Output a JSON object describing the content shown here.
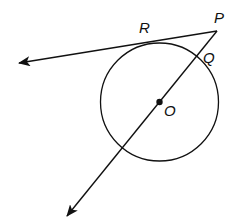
{
  "diagram": {
    "type": "geometry",
    "colors": {
      "stroke": "#111111",
      "background": "#ffffff"
    },
    "circle": {
      "center_label": "O",
      "cx": 159.5,
      "cy": 102,
      "r": 59
    },
    "points": {
      "P": {
        "label": "P",
        "x": 217,
        "y": 31
      },
      "R": {
        "label": "R",
        "x": 145,
        "y": 40
      },
      "Q": {
        "label": "Q",
        "x": 205,
        "y": 48
      },
      "O": {
        "label": "O",
        "x": 159.5,
        "y": 102
      }
    },
    "rays": [
      {
        "name": "tangent-ray-PR",
        "from": "P",
        "through": "R",
        "arrow_tip": {
          "x": 17,
          "y": 63
        }
      },
      {
        "name": "secant-ray-PO",
        "from": "P",
        "through": [
          "Q",
          "O"
        ],
        "arrow_tip": {
          "x": 66,
          "y": 218
        }
      }
    ],
    "labels": {
      "P": "P",
      "R": "R",
      "Q": "Q",
      "O": "O"
    }
  }
}
